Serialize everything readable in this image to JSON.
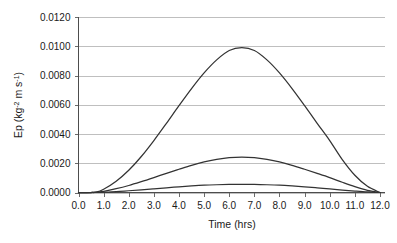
{
  "chart_data": {
    "type": "line",
    "title": "",
    "xlabel": "Time (hrs)",
    "ylabel": "Ep (kg-2 m s-1)",
    "ylabel_parts": {
      "prefix": "Ep (kg",
      "sup1": "-2",
      "mid": " m s",
      "sup2": "-1",
      "suffix": ")"
    },
    "xlim": [
      0.0,
      12.2
    ],
    "ylim": [
      0.0,
      0.012
    ],
    "grid": true,
    "grid_axis": "y",
    "legend": "none",
    "x_tick_labels": [
      "0.0",
      "1.0",
      "2.0",
      "3.0",
      "4.0",
      "5.0",
      "6.0",
      "7.0",
      "8.0",
      "9.0",
      "10.0",
      "11.0",
      "12.0"
    ],
    "x_tick_values": [
      0,
      1,
      2,
      3,
      4,
      5,
      6,
      7,
      8,
      9,
      10,
      11,
      12
    ],
    "y_tick_labels": [
      "0.0000",
      "0.0020",
      "0.0040",
      "0.0060",
      "0.0080",
      "0.0100",
      "0.0120"
    ],
    "y_tick_values": [
      0.0,
      0.002,
      0.004,
      0.006,
      0.008,
      0.01,
      0.012
    ],
    "line_color": "#333333",
    "grid_color": "#bfbfbf",
    "axis_color": "#4d4d4d",
    "background": "#ffffff",
    "x": [
      0.0,
      0.5,
      0.7,
      1.0,
      1.5,
      2.0,
      2.5,
      3.0,
      3.5,
      4.0,
      4.5,
      5.0,
      5.5,
      6.0,
      6.5,
      7.0,
      7.5,
      8.0,
      8.5,
      9.0,
      9.5,
      10.0,
      10.5,
      11.0,
      11.5,
      12.0
    ],
    "series": [
      {
        "name": "curve-upper",
        "peak_x": 6.5,
        "peak_y": 0.0099,
        "values": [
          0.0,
          0.0,
          2e-05,
          0.00022,
          0.00077,
          0.00152,
          0.00246,
          0.00355,
          0.00473,
          0.00594,
          0.00711,
          0.00818,
          0.00907,
          0.00971,
          0.0099,
          0.00971,
          0.00907,
          0.00818,
          0.00711,
          0.00594,
          0.00473,
          0.00355,
          0.00225,
          0.00118,
          0.00042,
          0.0
        ]
      },
      {
        "name": "curve-middle",
        "peak_x": 6.5,
        "peak_y": 0.0024,
        "values": [
          0.0,
          0.0,
          1e-05,
          8e-05,
          0.00026,
          0.00048,
          0.00074,
          0.00102,
          0.00131,
          0.00159,
          0.00186,
          0.00209,
          0.00226,
          0.00238,
          0.00242,
          0.00238,
          0.00226,
          0.00209,
          0.00186,
          0.00159,
          0.00131,
          0.00102,
          0.0007,
          0.0004,
          0.00015,
          0.0
        ]
      },
      {
        "name": "curve-lower",
        "peak_x": 6.5,
        "peak_y": 0.00055,
        "values": [
          0.0,
          0.0,
          3e-06,
          2e-05,
          6e-05,
          0.00012,
          0.00018,
          0.00025,
          0.00032,
          0.00039,
          0.00045,
          0.0005,
          0.00053,
          0.000548,
          0.000555,
          0.000548,
          0.00053,
          0.0005,
          0.00045,
          0.00039,
          0.00032,
          0.00025,
          0.00017,
          0.0001,
          4e-05,
          0.0
        ]
      }
    ]
  }
}
